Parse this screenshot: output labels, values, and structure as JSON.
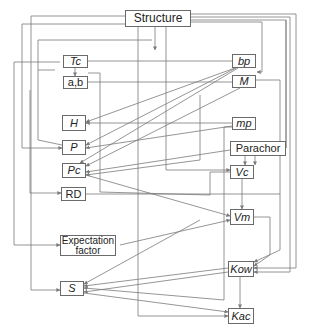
{
  "diagram": {
    "nodes": [
      {
        "id": "structure",
        "label": "Structure",
        "x": 125,
        "y": 10,
        "w": 66,
        "h": 17,
        "italic": false
      },
      {
        "id": "tc",
        "label": "Tc",
        "x": 63,
        "y": 55,
        "w": 25,
        "h": 13,
        "italic": true
      },
      {
        "id": "ab",
        "label": "a,b",
        "x": 63,
        "y": 76,
        "w": 25,
        "h": 13,
        "italic": false
      },
      {
        "id": "bp",
        "label": "bp",
        "x": 232,
        "y": 54,
        "w": 24,
        "h": 14,
        "italic": true
      },
      {
        "id": "m",
        "label": "M",
        "x": 232,
        "y": 75,
        "w": 24,
        "h": 13,
        "italic": true
      },
      {
        "id": "h",
        "label": "H",
        "x": 62,
        "y": 115,
        "w": 24,
        "h": 16,
        "italic": true
      },
      {
        "id": "mp",
        "label": "mp",
        "x": 232,
        "y": 117,
        "w": 24,
        "h": 13,
        "italic": true
      },
      {
        "id": "p",
        "label": "P",
        "x": 62,
        "y": 140,
        "w": 24,
        "h": 15,
        "italic": true
      },
      {
        "id": "parachor",
        "label": "Parachor",
        "x": 230,
        "y": 141,
        "w": 56,
        "h": 15,
        "italic": false
      },
      {
        "id": "pc",
        "label": "Pc",
        "x": 62,
        "y": 163,
        "w": 24,
        "h": 15,
        "italic": true
      },
      {
        "id": "vc",
        "label": "Vc",
        "x": 230,
        "y": 165,
        "w": 24,
        "h": 14,
        "italic": true
      },
      {
        "id": "rd",
        "label": "RD",
        "x": 61,
        "y": 187,
        "w": 25,
        "h": 14,
        "italic": false
      },
      {
        "id": "vm",
        "label": "Vm",
        "x": 230,
        "y": 209,
        "w": 24,
        "h": 16,
        "italic": true
      },
      {
        "id": "expectation",
        "label": "Expectation factor",
        "x": 60,
        "y": 235,
        "w": 56,
        "h": 21,
        "italic": false
      },
      {
        "id": "kow",
        "label": "Kow",
        "x": 228,
        "y": 261,
        "w": 26,
        "h": 16,
        "italic": true
      },
      {
        "id": "s",
        "label": "S",
        "x": 60,
        "y": 281,
        "w": 24,
        "h": 15,
        "italic": true
      },
      {
        "id": "kac",
        "label": "Kac",
        "x": 228,
        "y": 308,
        "w": 26,
        "h": 16,
        "italic": true
      }
    ],
    "edges": [
      {
        "from": "structure",
        "to": "tc"
      },
      {
        "from": "structure",
        "to": "bp"
      },
      {
        "from": "structure",
        "to": "m"
      },
      {
        "from": "structure",
        "to": "p"
      },
      {
        "from": "structure",
        "to": "rd"
      },
      {
        "from": "structure",
        "to": "expectation"
      },
      {
        "from": "structure",
        "to": "parachor"
      },
      {
        "from": "structure",
        "to": "kow"
      },
      {
        "from": "structure",
        "to": "vc"
      },
      {
        "from": "structure",
        "to": "kac"
      },
      {
        "from": "bp",
        "to": "tc"
      },
      {
        "from": "tc",
        "to": "ab"
      },
      {
        "from": "pc",
        "to": "ab"
      },
      {
        "from": "bp",
        "to": "h"
      },
      {
        "from": "bp",
        "to": "p"
      },
      {
        "from": "bp",
        "to": "pc"
      },
      {
        "from": "m",
        "to": "pc"
      },
      {
        "from": "mp",
        "to": "h"
      },
      {
        "from": "mp",
        "to": "p"
      },
      {
        "from": "mp",
        "to": "s"
      },
      {
        "from": "parachor",
        "to": "vc"
      },
      {
        "from": "tc",
        "to": "vc"
      },
      {
        "from": "pc",
        "to": "vm"
      },
      {
        "from": "vc",
        "to": "vm"
      },
      {
        "from": "expectation",
        "to": "vm"
      },
      {
        "from": "vm",
        "to": "kow"
      },
      {
        "from": "vm",
        "to": "s"
      },
      {
        "from": "kow",
        "to": "kac"
      },
      {
        "from": "kow",
        "to": "s"
      },
      {
        "from": "m",
        "to": "kow"
      },
      {
        "from": "s",
        "to": "kac"
      }
    ]
  }
}
